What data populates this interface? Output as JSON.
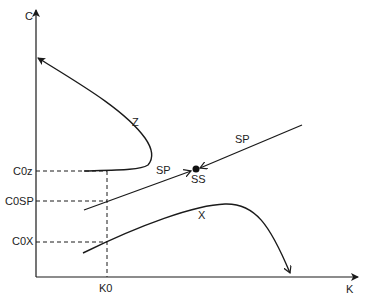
{
  "axes": {
    "y_label": "C",
    "x_label": "K"
  },
  "curves": {
    "z_label": "Z",
    "sp_label_left": "SP",
    "sp_label_right": "SP",
    "x_label": "X"
  },
  "point": {
    "label": "SS"
  },
  "levels": {
    "c0z": "C0z",
    "c0sp": "C0SP",
    "c0x": "C0X",
    "k0": "K0"
  },
  "colors": {
    "stroke": "#1a1a1a",
    "background": "#ffffff"
  }
}
